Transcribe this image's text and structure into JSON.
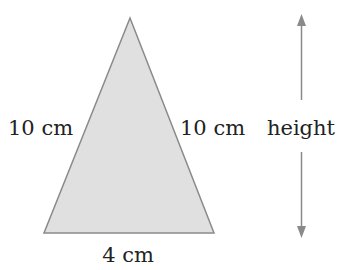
{
  "diagram": {
    "shape": "isosceles-triangle",
    "labels": {
      "left_side": "10 cm",
      "right_side": "10 cm",
      "base": "4 cm",
      "height": "height"
    },
    "colors": {
      "fill": "#e0e0e0",
      "stroke": "#8a8a8a",
      "arrow": "#8a8a8a",
      "text": "#222222"
    }
  }
}
